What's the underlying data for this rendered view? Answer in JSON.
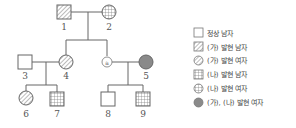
{
  "pedigree": {
    "individuals": [
      {
        "id": "1",
        "label": "1",
        "sex": "male",
        "phenotype": "(가) 발현"
      },
      {
        "id": "2",
        "label": "2",
        "sex": "female",
        "phenotype": "(나) 발현"
      },
      {
        "id": "3",
        "label": "3",
        "sex": "male",
        "phenotype": "정상"
      },
      {
        "id": "4",
        "label": "4",
        "sex": "female",
        "phenotype": "(가) 발현"
      },
      {
        "id": "a",
        "label": "ⓐ",
        "sex": "unknown",
        "phenotype": "미지정"
      },
      {
        "id": "5",
        "label": "5",
        "sex": "female",
        "phenotype": "(가), (나) 발현"
      },
      {
        "id": "6",
        "label": "6",
        "sex": "female",
        "phenotype": "(가) 발현"
      },
      {
        "id": "7",
        "label": "7",
        "sex": "male",
        "phenotype": "(나) 발현"
      },
      {
        "id": "8",
        "label": "8",
        "sex": "male",
        "phenotype": "정상"
      },
      {
        "id": "9",
        "label": "9",
        "sex": "male",
        "phenotype": "(나) 발현"
      }
    ],
    "small_marker_label": "a"
  },
  "legend": {
    "items": [
      {
        "symbol": "plain-square",
        "label": "정상 남자"
      },
      {
        "symbol": "hatched-square",
        "label": "(가) 발현 남자"
      },
      {
        "symbol": "hatched-circle",
        "label": "(가) 발현 여자"
      },
      {
        "symbol": "grid-square",
        "label": "(나) 발현 남자"
      },
      {
        "symbol": "grid-circle",
        "label": "(나) 발현 여자"
      },
      {
        "symbol": "filled-circle",
        "label": "(가), (나) 발현 여자"
      }
    ]
  },
  "colors": {
    "line": "#666666",
    "fill_both": "#8a8a8a",
    "hatch": "#777777"
  }
}
